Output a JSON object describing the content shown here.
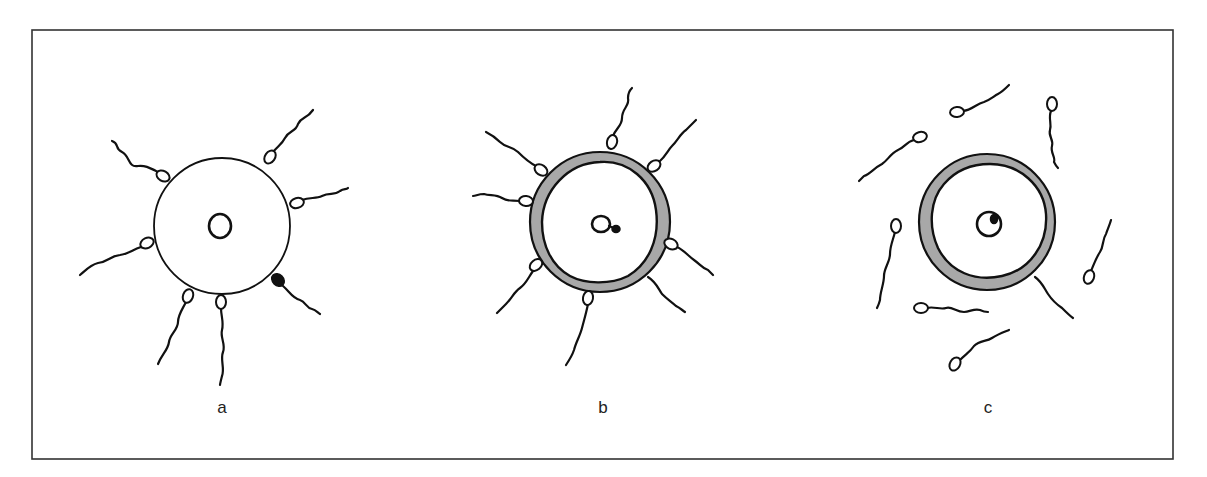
{
  "figure": {
    "colors": {
      "line": "#111111",
      "frame": "#333333",
      "zona_fill": "#a8a8a8",
      "background": "#ffffff"
    },
    "panels": [
      {
        "label": "a",
        "state": "sperm attached to egg surface; one sperm (black head) fusing",
        "attached_sperm_count": 7,
        "fused_sperm_count": 1,
        "zona_shaded": false
      },
      {
        "label": "b",
        "state": "zona thickened/shaded after sperm entry; sperm head inside beside nucleus",
        "attached_sperm_count": 7,
        "zona_shaded": true
      },
      {
        "label": "c",
        "state": "sperm detached and swimming away; sperm nucleus inside egg nucleus",
        "free_sperm_count": 7,
        "zona_shaded": true
      }
    ]
  }
}
